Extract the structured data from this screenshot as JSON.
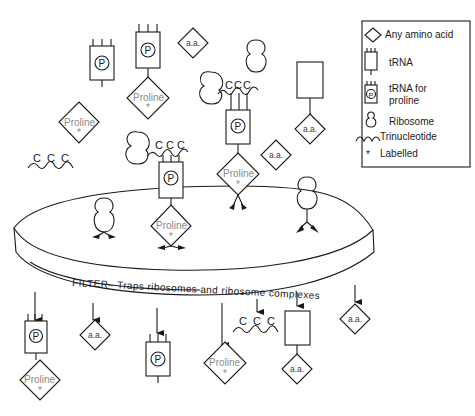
{
  "legend": {
    "items": [
      {
        "icon": "diamond-icon",
        "label": "Any amino acid"
      },
      {
        "icon": "trna-icon",
        "label": "tRNA"
      },
      {
        "icon": "trna-proline-icon",
        "label": "tRNA for",
        "label2": "proline"
      },
      {
        "icon": "ribosome-icon",
        "label": "Ribosome"
      },
      {
        "icon": "trinucleotide-icon",
        "label": "Trinucleotide"
      },
      {
        "icon": "asterisk-icon",
        "label": "Labelled"
      }
    ]
  },
  "labels": {
    "amino_acid": "a.a.",
    "proline": "Proline",
    "labelled_mark": "*",
    "proline_trna_mark": "P",
    "trinucleotide_letter": "C",
    "filter": "FILTER– Traps  ribosomes  and  ribosome  complexes"
  },
  "colors": {
    "ink": "#1a1a1a",
    "proline_text": "#8a8a8a",
    "background": "#ffffff"
  },
  "sections": {
    "above_filter": [
      "tRNA-proline",
      "tRNA-proline + Proline*",
      "a.a.",
      "Proline*",
      "CCC trinucleotide",
      "ribosome + CCC + tRNA-proline",
      "ribosome + CCC + tRNA-proline + Proline*",
      "ribosome",
      "tRNA + a.a.",
      "a.a."
    ],
    "on_filter": [
      "ribosome",
      "Proline*",
      "ribosome"
    ],
    "below_filter": [
      "tRNA-proline + Proline*",
      "a.a.",
      "tRNA-proline",
      "Proline*",
      "CCC trinucleotide",
      "tRNA + a.a.",
      "a.a."
    ]
  }
}
